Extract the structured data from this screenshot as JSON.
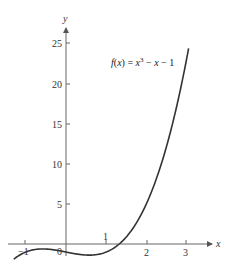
{
  "chart_data": {
    "type": "line",
    "title": "",
    "function_label": "f(x) = x³ − x − 1",
    "function_label_parts": {
      "prefix": "f(x) = x",
      "exponent": "3",
      "suffix": " − x − 1"
    },
    "xlabel": "x",
    "ylabel": "y",
    "xlim": [
      -1.3,
      3.5
    ],
    "ylim": [
      -2,
      27
    ],
    "x_ticks": [
      -1,
      1,
      2,
      3
    ],
    "x_tick_labels": [
      "−1",
      "1",
      "2",
      "3"
    ],
    "origin_label": "0",
    "y_ticks": [
      5,
      10,
      15,
      20,
      25
    ],
    "y_tick_labels": [
      "5",
      "10",
      "15",
      "20",
      "25"
    ],
    "grid": false,
    "legend": "none",
    "series": [
      {
        "name": "f(x) = x^3 - x - 1",
        "x": [
          -1.3,
          -1,
          -0.577,
          0,
          0.577,
          1,
          1.3247,
          1.5,
          2,
          2.5,
          3,
          3.05
        ],
        "y": [
          -1.897,
          -1,
          -0.615,
          -1,
          -1.385,
          -1,
          0,
          0.875,
          5,
          11.625,
          23,
          24.32
        ]
      }
    ],
    "colors": {
      "curve": "#333333",
      "axis": "#555555"
    }
  }
}
